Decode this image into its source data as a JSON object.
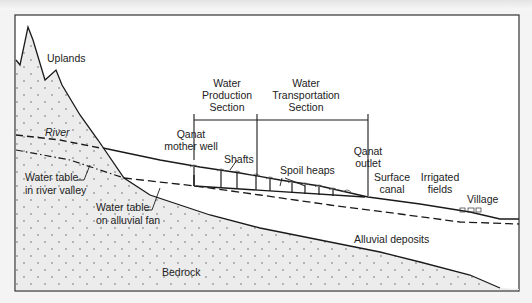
{
  "diagram": {
    "labels": {
      "uplands": "Uplands",
      "river": "River",
      "water_table_river_1": "Water table",
      "water_table_river_2": "in river valley",
      "water_table_fan_1": "Water table",
      "water_table_fan_2": "on alluvial fan",
      "bedrock": "Bedrock",
      "alluvial_deposits": "Alluvial deposits",
      "production_1": "Water",
      "production_2": "Production",
      "production_3": "Section",
      "transport_1": "Water",
      "transport_2": "Transportation",
      "transport_3": "Section",
      "mother_well_1": "Qanat",
      "mother_well_2": "mother well",
      "shafts": "Shafts",
      "spoil_heaps": "Spoil heaps",
      "outlet_1": "Qanat",
      "outlet_2": "outlet",
      "canal_1": "Surface",
      "canal_2": "canal",
      "fields_1": "Irrigated",
      "fields_2": "fields",
      "village": "Village"
    },
    "colors": {
      "line": "#1a1a1a",
      "bedrock_fill": "#e9e9e9",
      "dot": "#9a9a9a",
      "background": "#ffffff"
    }
  }
}
